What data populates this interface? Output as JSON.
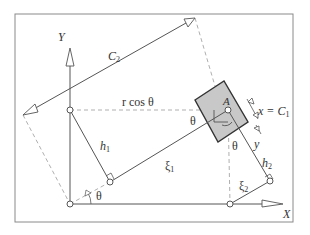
{
  "diagram": {
    "type": "geometry-schematic",
    "colors": {
      "frame": "#8a8a8a",
      "line": "#555555",
      "dashed": "#a0a0a0",
      "box_fill": "#c8c8c8",
      "box_stroke": "#333333"
    },
    "labels": {
      "y_axis": "Y",
      "x_axis": "X",
      "c2": "C",
      "c2_sub": "2",
      "r_cos_theta": "r cos θ",
      "point_a": "A",
      "x_eq": "x = C",
      "x_eq_sub": "1",
      "y_label": "y",
      "theta_box": "θ",
      "theta_below": "θ",
      "theta_origin": "θ",
      "h1": "h",
      "h1_sub": "1",
      "h2": "h",
      "h2_sub": "2",
      "xi1": "ξ",
      "xi1_sub": "1",
      "xi2": "ξ",
      "xi2_sub": "2"
    }
  }
}
